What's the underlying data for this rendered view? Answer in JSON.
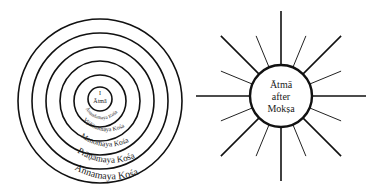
{
  "left_diagram": {
    "name": "Pancha Kosha concentric sheaths",
    "center_labels": {
      "line1": "I",
      "line2": "Ātmā"
    },
    "sheaths": [
      {
        "label": "Ānandamaya Kośa",
        "order": 1
      },
      {
        "label": "Vijñānamaya Kośa",
        "order": 2
      },
      {
        "label": "Manomaya Kośa",
        "order": 3
      },
      {
        "label": "Prāṇamaya Kośa",
        "order": 4
      },
      {
        "label": "Annamaya Kośa",
        "order": 5
      }
    ],
    "ring_count": 6
  },
  "right_diagram": {
    "name": "Ātmā after Mokṣa radiant",
    "center_labels": {
      "line1": "Ātmā",
      "line2": "after",
      "line3": "Mokṣa"
    },
    "ray_count": 16,
    "long_rays": 8,
    "short_rays": 8
  },
  "colors": {
    "line": "#111111",
    "background": "#ffffff"
  }
}
